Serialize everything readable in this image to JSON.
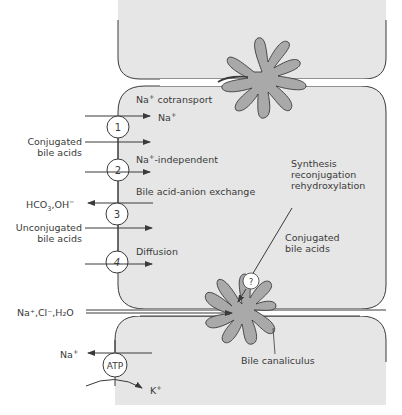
{
  "colors": {
    "cell_fill": "#e6e6e6",
    "canaliculus_fill": "#a9a9a9",
    "stroke": "#3a3a3a",
    "background": "#ffffff"
  },
  "cells": [
    "upper hepatocyte",
    "middle hepatocyte",
    "lower hepatocyte"
  ],
  "transporters": [
    {
      "id": "1",
      "label": "1",
      "name": "Na+ cotransport"
    },
    {
      "id": "2",
      "label": "2",
      "name": "Na+-independent"
    },
    {
      "id": "3",
      "label": "3",
      "name": "Bile acid-anion exchange"
    },
    {
      "id": "4",
      "label": "4",
      "name": "Diffusion"
    },
    {
      "id": "atp",
      "label": "ATP",
      "name": "Na+/K+ ATPase"
    },
    {
      "id": "q",
      "label": "?",
      "name": "canalicular transporter"
    }
  ],
  "labels": {
    "na_cotransport": "Na",
    "na_cotransport_sup": "+",
    "na_cotransport_rest": " cotransport",
    "na_in": "Na",
    "na_in_sup": "+",
    "conjugated_bile_acids_left_1": "Conjugated",
    "conjugated_bile_acids_left_2": "bile acids",
    "na_independent": "Na",
    "na_independent_sup": "+",
    "na_independent_rest": "-independent",
    "bile_acid_anion_exchange": "Bile acid-anion exchange",
    "hco3_oh": "HCO",
    "hco3_sub": "3",
    "hco3_sup": "−",
    "hco3_oh_rest": ",OH",
    "oh_sup": "−",
    "unconjugated_1": "Unconjugated",
    "unconjugated_2": "bile acids",
    "diffusion": "Diffusion",
    "synthesis_1": "Synthesis",
    "synthesis_2": "reconjugation",
    "synthesis_3": "rehydroxylation",
    "conjugated_bile_acids_right_1": "Conjugated",
    "conjugated_bile_acids_right_2": "bile acids",
    "paracellular": "Na⁺,Cl⁻,H₂O",
    "na_out": "Na",
    "na_out_sup": "+",
    "k_in": "K",
    "k_in_sup": "+",
    "bile_canaliculus": "Bile canaliculus"
  }
}
